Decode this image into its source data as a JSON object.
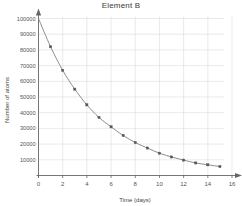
{
  "chart_data": {
    "type": "line",
    "title": "Element B",
    "xlabel": "Time (days)",
    "ylabel": "Number of atoms",
    "x": [
      0,
      1,
      2,
      3,
      4,
      5,
      6,
      7,
      8,
      9,
      10,
      11,
      12,
      13,
      14,
      15
    ],
    "values": [
      100000,
      82000,
      67000,
      55000,
      45000,
      37000,
      31000,
      25500,
      21000,
      17500,
      14200,
      11800,
      9800,
      8000,
      6800,
      5700
    ],
    "series": [
      {
        "name": "Element B",
        "values": [
          100000,
          82000,
          67000,
          55000,
          45000,
          37000,
          31000,
          25500,
          21000,
          17500,
          14200,
          11800,
          9800,
          8000,
          6800,
          5700
        ]
      }
    ],
    "xlim": [
      0,
      16
    ],
    "ylim": [
      0,
      100000
    ],
    "xticks": [
      0,
      2,
      4,
      6,
      8,
      10,
      12,
      14,
      16
    ],
    "xtick_labels": [
      "0",
      "2",
      "4",
      "6",
      "8",
      "10",
      "12",
      "14",
      "16"
    ],
    "yticks": [
      10000,
      20000,
      30000,
      40000,
      50000,
      60000,
      70000,
      80000,
      90000,
      100000
    ],
    "ytick_labels": [
      "10000",
      "20000",
      "30000",
      "40000",
      "50000",
      "60000",
      "70000",
      "80000",
      "90000",
      "100000"
    ],
    "grid": true,
    "legend": false,
    "marker": "square",
    "line_color": "#7a7a7a",
    "marker_color": "#555555",
    "grid_color": "#dcdcdc",
    "axis_color": "#666666"
  }
}
